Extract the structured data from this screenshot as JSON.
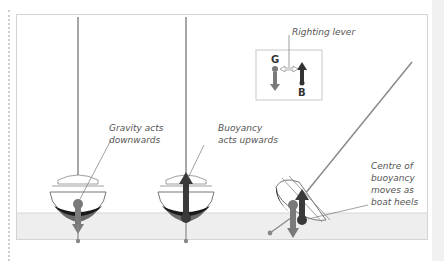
{
  "diagram": {
    "labels": {
      "gravity": "Gravity acts\ndownwards",
      "buoyancy": "Buoyancy\nacts upwards",
      "righting_lever": "Righting lever",
      "centre_buoyancy": "Centre of\nbuoyancy\nmoves as\nboat heels",
      "G": "G",
      "B": "B"
    },
    "colors": {
      "water": "#eeeeee",
      "hull_outline": "#777777",
      "keel_shadow": "#1a1a1a",
      "gravity_arrow": "#7a7a7a",
      "buoyancy_arrow": "#3a3a3a",
      "mast": "#8a8a8a",
      "frame_border": "#d4d4d4"
    },
    "boats": [
      {
        "name": "upright-gravity",
        "heel_deg": 0
      },
      {
        "name": "upright-buoyancy",
        "heel_deg": 0
      },
      {
        "name": "heeled",
        "heel_deg": 40
      }
    ]
  }
}
